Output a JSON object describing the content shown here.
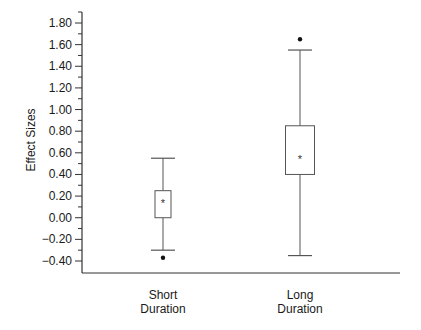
{
  "chart_data": {
    "type": "box",
    "title": "",
    "xlabel": "",
    "ylabel": "Effect Sizes",
    "ylim": [
      -0.5,
      1.9
    ],
    "yticks": [
      -0.4,
      -0.2,
      0.0,
      0.2,
      0.4,
      0.6,
      0.8,
      1.0,
      1.2,
      1.4,
      1.6,
      1.8
    ],
    "ytick_labels": [
      "-0.40",
      "-0.20",
      "0.00",
      "0.20",
      "0.40",
      "0.60",
      "0.80",
      "1.00",
      "1.20",
      "1.40",
      "1.60",
      "1.80"
    ],
    "minor_ticks": true,
    "grid": false,
    "legend": null,
    "categories": [
      "Short Duration",
      "Long Duration"
    ],
    "category_lines": [
      [
        "Short",
        "Duration"
      ],
      [
        "Long",
        "Duration"
      ]
    ],
    "series": [
      {
        "name": "Short Duration",
        "whisker_low": -0.3,
        "q1": 0.0,
        "mean": 0.15,
        "q3": 0.25,
        "whisker_high": 0.55,
        "mean_marker": "*",
        "outliers": [
          -0.37
        ]
      },
      {
        "name": "Long Duration",
        "whisker_low": -0.35,
        "q1": 0.4,
        "mean": 0.55,
        "q3": 0.85,
        "whisker_high": 1.55,
        "mean_marker": "*",
        "outliers": [
          1.65
        ]
      }
    ]
  },
  "colors": {
    "line": "#555555",
    "axis": "#333333",
    "text": "#1a1a1a",
    "background": "#ffffff"
  }
}
